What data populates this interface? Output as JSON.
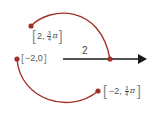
{
  "colors": {
    "arc": "#a23028",
    "arrow": "#1a1a1a",
    "text": "#555555"
  },
  "arrow": {
    "length_label": "2"
  },
  "points": [
    {
      "id": "p1",
      "coords": "[2, 3/4 π]",
      "open": "[",
      "r": "2,",
      "num": "3",
      "den": "4",
      "pi": "π",
      "close": "]"
    },
    {
      "id": "p2",
      "coords": "[−2,0]",
      "open": "[",
      "text": "−2,0",
      "close": "]"
    },
    {
      "id": "p3",
      "coords": "[−2, 3/4 π]",
      "open": "[",
      "r": "−2,",
      "num": "3",
      "den": "4",
      "pi": "π",
      "close": "]"
    }
  ]
}
